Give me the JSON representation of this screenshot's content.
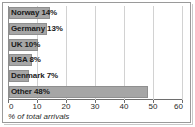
{
  "chart_data": {
    "type": "bar",
    "orientation": "horizontal",
    "title": "",
    "subtitle": "",
    "xlabel": "% of total arrivals",
    "ylabel": "",
    "categories": [
      "Norway",
      "Germany",
      "UK",
      "USA",
      "Denmark",
      "Other"
    ],
    "values": [
      14,
      13,
      10,
      8,
      7,
      48
    ],
    "data_labels": [
      "Norway 14%",
      "Germany 13%",
      "UK 10%",
      "USA 8%",
      "Denmark 7%",
      "Other 48%"
    ],
    "xlim": [
      0,
      60
    ],
    "xticks": [
      0,
      10,
      20,
      30,
      40,
      50,
      60
    ],
    "xtick_labels": [
      "0",
      "10",
      "20",
      "30",
      "40",
      "50",
      "60"
    ],
    "grid": "vertical",
    "legend": "none",
    "bar_color": "#a6a6a6",
    "bar_border_color": "#8f8f8f",
    "label_color": "#1a1a1a",
    "gridline_color": "#d2d2d2",
    "axis_color": "#6e6e6e",
    "background_color": "#ffffff",
    "frame_color": "#9a9a9a"
  }
}
